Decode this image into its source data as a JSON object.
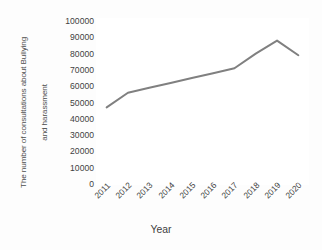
{
  "chart_data": {
    "type": "line",
    "title": "",
    "xlabel": "Year",
    "ylabel": "The number of consultations about Bullying and harassment",
    "categories": [
      "2011",
      "2012",
      "2013",
      "2014",
      "2015",
      "2016",
      "2017",
      "2018",
      "2019",
      "2020"
    ],
    "values": [
      47000,
      56000,
      59000,
      62000,
      65000,
      68000,
      71000,
      80000,
      88000,
      79000
    ],
    "series": [
      {
        "name": "The number of consultations about Bullying and harassment",
        "values": [
          47000,
          56000,
          59000,
          62000,
          65000,
          68000,
          71000,
          80000,
          88000,
          79000
        ]
      }
    ],
    "ylim": [
      0,
      100000
    ],
    "ytick_values": [
      0,
      10000,
      20000,
      30000,
      40000,
      50000,
      60000,
      70000,
      80000,
      90000,
      100000
    ],
    "ytick_labels": [
      "0",
      "10000",
      "20000",
      "30000",
      "40000",
      "50000",
      "60000",
      "70000",
      "80000",
      "90000",
      "100000"
    ],
    "xtick_labels": [
      "2011",
      "2012",
      "2013",
      "2014",
      "2015",
      "2016",
      "2017",
      "2018",
      "2019",
      "2020"
    ],
    "grid": false,
    "legend": false,
    "legend_position": "none",
    "line_color": "#808080",
    "line_width": 2,
    "markers": false,
    "background_color": "#ffffff",
    "axis_text_color": "#3f3f3f"
  },
  "axes": {
    "y_title_line1": "The number of consultations about Bullying",
    "y_title_line2": "and harassment",
    "x_title": "Year"
  }
}
